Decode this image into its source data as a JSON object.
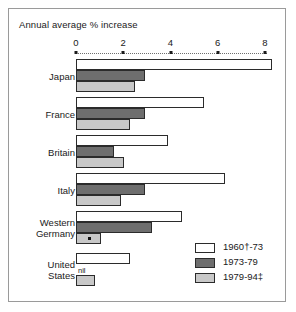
{
  "chart_data": {
    "type": "bar",
    "orientation": "horizontal",
    "title": "Annual average % increase",
    "xlabel": "",
    "ylabel": "",
    "xlim": [
      0,
      8.6
    ],
    "ticks": [
      0,
      2,
      4,
      6,
      8
    ],
    "tick_labels": [
      "0",
      "2",
      "4",
      "6",
      "8"
    ],
    "grid": false,
    "legend_position": "bottom-right",
    "categories": [
      "Japan",
      "France",
      "Britain",
      "Italy",
      "Western Germany",
      "United States"
    ],
    "series": [
      {
        "name": "1960†-73",
        "color": "#ffffff",
        "values": [
          8.3,
          5.4,
          3.9,
          6.3,
          4.5,
          2.3
        ]
      },
      {
        "name": "1973-79",
        "color": "#6e6e6e",
        "values": [
          2.9,
          2.9,
          1.6,
          2.9,
          3.2,
          0
        ]
      },
      {
        "name": "1979-94‡",
        "color": "#c8c8c8",
        "values": [
          2.5,
          2.3,
          2.05,
          1.9,
          1.05,
          0.8
        ]
      }
    ],
    "annotations": [
      {
        "text": "nil",
        "category": "United States",
        "series": "1973-79",
        "note": "zero value label above the 1979-94 bar"
      },
      {
        "text": "*",
        "category": "Western Germany",
        "series": "1979-94‡",
        "note": "asterisk marker inside bar"
      }
    ]
  },
  "category_labels": [
    {
      "line1": "Japan",
      "line2": ""
    },
    {
      "line1": "France",
      "line2": ""
    },
    {
      "line1": "Britain",
      "line2": ""
    },
    {
      "line1": "Italy",
      "line2": ""
    },
    {
      "line1": "Western",
      "line2": "Germany"
    },
    {
      "line1": "United",
      "line2": "States"
    }
  ],
  "legend": {
    "items": [
      {
        "label": "1960†-73"
      },
      {
        "label": "1973-79"
      },
      {
        "label": "1979-94‡"
      }
    ]
  },
  "marks": {
    "nil_label": "nil",
    "asterisk": "*"
  }
}
